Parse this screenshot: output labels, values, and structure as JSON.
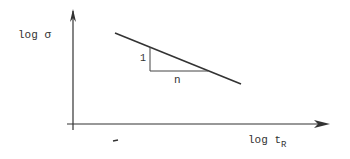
{
  "diagram": {
    "y_label": "log σ",
    "x_label_main": "log t",
    "x_label_sub": "R",
    "slope_rise_label": "1",
    "slope_run_label": "n",
    "stroke_color": "#333333"
  }
}
